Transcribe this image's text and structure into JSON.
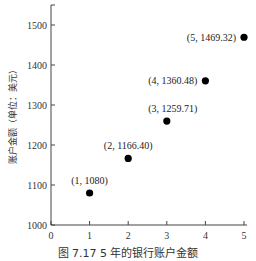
{
  "chart_data": {
    "type": "scatter",
    "title": "",
    "caption": "图 7.17   5 年的银行账户金额",
    "xlabel": "",
    "ylabel": "账户金额（单位：美元）",
    "x": [
      1,
      2,
      3,
      4,
      5
    ],
    "values": [
      1080,
      1166.4,
      1259.71,
      1360.48,
      1469.32
    ],
    "point_labels": [
      "(1, 1080)",
      "(2, 1166.40)",
      "(3, 1259.71)",
      "(4, 1360.48)",
      "(5, 1469.32)"
    ],
    "xlim": [
      0,
      5
    ],
    "ylim": [
      1000,
      1550
    ],
    "x_ticks": [
      "0",
      "1",
      "2",
      "3",
      "4",
      "5"
    ],
    "y_ticks": [
      "1000",
      "1100",
      "1200",
      "1300",
      "1400",
      "1500"
    ],
    "grid": false,
    "legend": null,
    "marker_color": "#000000"
  }
}
